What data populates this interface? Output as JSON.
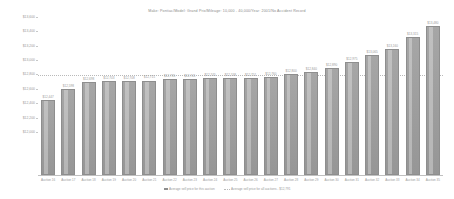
{
  "chart": {
    "title": "Make: Pontiac/Model: Grand Prix/Mileage: 10,000 - 40,000/Year: 2001/No Accident Record"
  },
  "legend": {
    "series_label": "Average sell price for this auction",
    "average_label": "Average sell price for all auctions - $12,791"
  },
  "chart_data": {
    "type": "bar",
    "title": "Make: Pontiac/Model: Grand Prix/Mileage: 10,000 - 40,000/Year: 2001/No Accident Record",
    "xlabel": "",
    "ylabel": "",
    "ylim": [
      11400,
      13600
    ],
    "grid": false,
    "legend_position": "bottom",
    "yticks": [
      13600,
      13400,
      13200,
      13000,
      12800,
      12600,
      12400,
      12200,
      12000
    ],
    "ytick_labels": [
      "$13,600",
      "$13,400",
      "$13,200",
      "$13,000",
      "$12,800",
      "$12,600",
      "$12,400",
      "$12,200",
      "$12,000"
    ],
    "categories": [
      "Auction 16",
      "Auction 17",
      "Auction 18",
      "Auction 19",
      "Auction 20",
      "Auction 21",
      "Auction 22",
      "Auction 23",
      "Auction 24",
      "Auction 25",
      "Auction 26",
      "Auction 27",
      "Auction 28",
      "Auction 29",
      "Auction 30",
      "Auction 31",
      "Auction 32",
      "Auction 33",
      "Auction 34",
      "Auction 35"
    ],
    "values": [
      12447,
      12598,
      12698,
      12703,
      12708,
      12715,
      12735,
      12741,
      12745,
      12748,
      12751,
      12760,
      12800,
      12840,
      12890,
      12975,
      13065,
      13160,
      13315,
      13480
    ],
    "value_labels": [
      "$12,447",
      "$12,598",
      "$12,698",
      "$12,703",
      "$12,708",
      "$12,715",
      "$12,735",
      "$12,741",
      "$12,745",
      "$12,748",
      "$12,751",
      "$12,760",
      "$12,800",
      "$12,840",
      "$12,890",
      "$12,975",
      "$13,065",
      "$13,160",
      "$13,315",
      "$13,480"
    ],
    "average_line": {
      "value": 12791,
      "label": "Average sell price for all auctions - $12,791",
      "style": "dotted"
    },
    "series": [
      {
        "name": "Average sell price for this auction",
        "color": "#9d9d9d"
      }
    ]
  }
}
